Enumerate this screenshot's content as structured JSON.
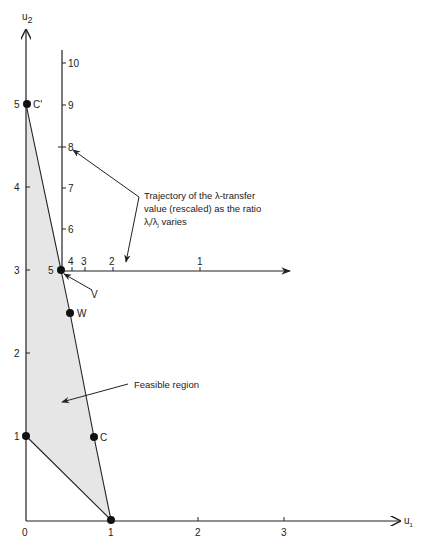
{
  "colors": {
    "ink": "#222222",
    "feasible_fill": "#e6e6e6",
    "background": "#ffffff"
  },
  "axes": {
    "u1_label": "u",
    "u1_sub": "1",
    "u2_label": "u",
    "u2_sub": "2",
    "u1_ticks": [
      {
        "label": "0",
        "value": 0
      },
      {
        "label": "1",
        "value": 1
      },
      {
        "label": "2",
        "value": 2
      },
      {
        "label": "3",
        "value": 3
      }
    ],
    "u2_ticks": [
      {
        "label": "1",
        "value": 1
      },
      {
        "label": "2",
        "value": 2
      },
      {
        "label": "3",
        "value": 3
      },
      {
        "label": "4",
        "value": 4
      },
      {
        "label": "5",
        "value": 5
      }
    ]
  },
  "secondary_axes": {
    "vertical_ticks": [
      "6",
      "7",
      "8",
      "9",
      "10"
    ],
    "horizontal_ticks": [
      "4",
      "3",
      "2",
      "1"
    ],
    "origin_label": "5"
  },
  "points": [
    {
      "name": "C'",
      "u1": 0,
      "u2": 5
    },
    {
      "name": "V",
      "u1": 0.42,
      "u2": 3
    },
    {
      "name": "W",
      "u1": 0.52,
      "u2": 2.5
    },
    {
      "name": "C",
      "u1": 0.8,
      "u2": 1
    },
    {
      "name": "",
      "u1": 0,
      "u2": 1
    },
    {
      "name": "",
      "u1": 1,
      "u2": 0
    }
  ],
  "labels": {
    "c_prime": "C'",
    "v": "V",
    "w": "W",
    "c": "C",
    "feasible_region": "Feasible region",
    "trajectory_line1": "Trajectory of the λ-transfer",
    "trajectory_line2": "value (rescaled) as the ratio",
    "trajectory_line3_a": "λ",
    "trajectory_line3_sub_i": "i",
    "trajectory_line3_b": "/λ",
    "trajectory_line3_sub_j": "j",
    "trajectory_line3_c": " varies"
  }
}
